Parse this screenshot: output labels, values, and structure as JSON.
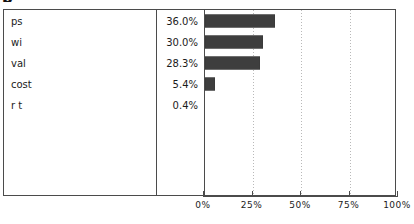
{
  "title_glyph": "b",
  "table": {
    "columns": [
      "category",
      "percent",
      "bar"
    ],
    "rows": [
      {
        "label": "ps",
        "percent_text": "36.0%",
        "value": 36.0
      },
      {
        "label": "wi",
        "percent_text": "30.0%",
        "value": 30.0
      },
      {
        "label": "val",
        "percent_text": "28.3%",
        "value": 28.3
      },
      {
        "label": "cost",
        "percent_text": "5.4%",
        "value": 5.4
      },
      {
        "label": "r t",
        "percent_text": "0.4%",
        "value": 0.4
      }
    ]
  },
  "axis": {
    "ticks": [
      {
        "label": "0%",
        "value": 0
      },
      {
        "label": "25%",
        "value": 25
      },
      {
        "label": "50%",
        "value": 50
      },
      {
        "label": "75%",
        "value": 75
      },
      {
        "label": "100%",
        "value": 100
      }
    ]
  },
  "colors": {
    "bar_fill": "#4d4d4d",
    "bar_pattern": "#2e2e2e",
    "border": "#4b4b4b",
    "gridline": "#b9b9b9",
    "text": "#1b1b1b",
    "background": "#ffffff"
  },
  "chart_data": {
    "type": "bar",
    "orientation": "horizontal",
    "title": "",
    "xlabel": "",
    "ylabel": "",
    "categories": [
      "ps",
      "wi",
      "val",
      "cost",
      "r t"
    ],
    "values": [
      36.0,
      30.0,
      28.3,
      5.4,
      0.4
    ],
    "data_labels": [
      "36.0%",
      "30.0%",
      "28.3%",
      "5.4%",
      "0.4%"
    ],
    "xlim": [
      0,
      100
    ],
    "xticks": [
      0,
      25,
      50,
      75,
      100
    ],
    "xticklabels": [
      "0%",
      "25%",
      "50%",
      "75%",
      "100%"
    ],
    "grid": true,
    "grid_axis": "x",
    "grid_style": "dotted",
    "legend": false,
    "series": [
      {
        "name": "percent",
        "values": [
          36.0,
          30.0,
          28.3,
          5.4,
          0.4
        ]
      }
    ]
  }
}
